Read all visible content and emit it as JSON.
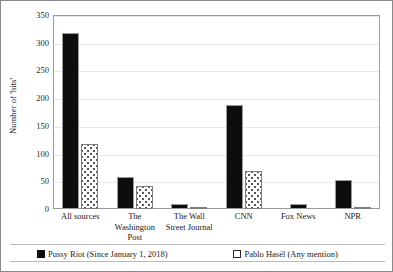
{
  "chart_data": {
    "type": "bar",
    "title": "",
    "xlabel": "",
    "ylabel": "Number of 'hits'",
    "ylim": [
      0,
      350
    ],
    "ytick_labels": [
      "350",
      "300",
      "250",
      "200",
      "150",
      "100",
      "50",
      "0"
    ],
    "ytick_values": [
      350,
      300,
      250,
      200,
      150,
      100,
      50,
      0
    ],
    "grid": true,
    "legend_position": "bottom",
    "categories": [
      "All sources",
      "The Washington Post",
      "The Wall Street Journal",
      "CNN",
      "Fox News",
      "NPR"
    ],
    "series": [
      {
        "name": "Pussy Riot (Since January 1, 2018)",
        "color": "#0d0d0d",
        "pattern": "solid",
        "values": [
          318,
          58,
          9,
          187,
          9,
          52
        ]
      },
      {
        "name": "Pablo Hasél (Any mention)",
        "color": "#ffffff",
        "pattern": "dotted",
        "values": [
          117,
          41,
          2,
          68,
          0,
          3
        ]
      }
    ]
  },
  "axis": {
    "y_title": "Number of 'hits'"
  },
  "legend": {
    "items": [
      {
        "label": "Pussy Riot (Since January 1, 2018)"
      },
      {
        "label": "Pablo Hasél (Any mention)"
      }
    ]
  }
}
